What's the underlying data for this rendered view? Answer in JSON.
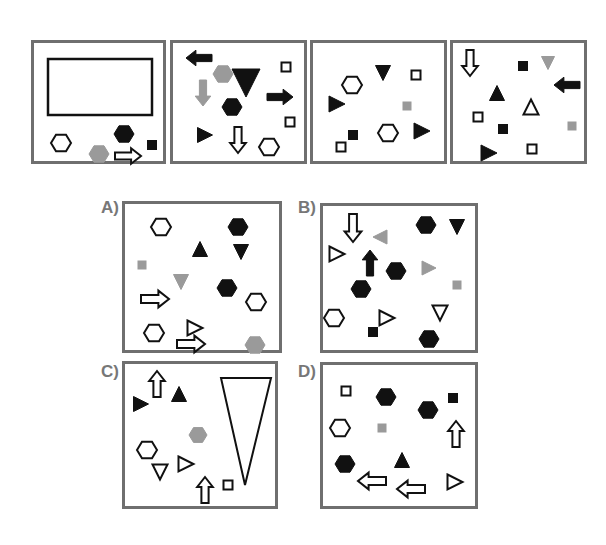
{
  "colors": {
    "black": "#111111",
    "gray": "#9a9a9a",
    "outline": "#111111",
    "panel_border": "#6f6f6f",
    "label": "#777777"
  },
  "sequence": [
    {
      "id": "seq-1",
      "x": 31,
      "y": 40,
      "w": 135,
      "h": 124,
      "shapes": [
        {
          "type": "rect",
          "x": 14,
          "y": 16,
          "w": 104,
          "h": 56,
          "fill": "none",
          "stroke": "#111",
          "sw": 2.5
        },
        {
          "type": "hexagon",
          "cx": 27,
          "cy": 100,
          "r": 10,
          "fill": "none"
        },
        {
          "type": "hexagon",
          "cx": 65,
          "cy": 111,
          "r": 10,
          "fill": "gray"
        },
        {
          "type": "hexagon",
          "cx": 90,
          "cy": 91,
          "r": 10,
          "fill": "black"
        },
        {
          "type": "arrow",
          "cx": 94,
          "cy": 113,
          "len": 26,
          "dir": "right",
          "fill": "none"
        },
        {
          "type": "square",
          "cx": 118,
          "cy": 102,
          "s": 9,
          "fill": "black"
        }
      ]
    },
    {
      "id": "seq-2",
      "x": 170,
      "y": 40,
      "w": 137,
      "h": 124,
      "shapes": [
        {
          "type": "arrow",
          "cx": 26,
          "cy": 15,
          "len": 26,
          "dir": "left",
          "fill": "black"
        },
        {
          "type": "hexagon",
          "cx": 50,
          "cy": 31,
          "r": 10,
          "fill": "gray"
        },
        {
          "type": "triangle",
          "cx": 73,
          "cy": 40,
          "size": 28,
          "dir": "down",
          "fill": "black"
        },
        {
          "type": "arrow",
          "cx": 30,
          "cy": 50,
          "len": 26,
          "dir": "down",
          "fill": "gray"
        },
        {
          "type": "arrow",
          "cx": 107,
          "cy": 54,
          "len": 26,
          "dir": "right",
          "fill": "black"
        },
        {
          "type": "hexagon",
          "cx": 59,
          "cy": 64,
          "r": 10,
          "fill": "black"
        },
        {
          "type": "square",
          "cx": 113,
          "cy": 24,
          "s": 9,
          "fill": "none"
        },
        {
          "type": "square",
          "cx": 117,
          "cy": 79,
          "s": 9,
          "fill": "none"
        },
        {
          "type": "triangle",
          "cx": 32,
          "cy": 92,
          "size": 15,
          "dir": "right",
          "fill": "black"
        },
        {
          "type": "arrow",
          "cx": 65,
          "cy": 97,
          "len": 26,
          "dir": "down",
          "fill": "none"
        },
        {
          "type": "hexagon",
          "cx": 96,
          "cy": 104,
          "r": 10,
          "fill": "none"
        }
      ]
    },
    {
      "id": "seq-3",
      "x": 310,
      "y": 40,
      "w": 137,
      "h": 124,
      "shapes": [
        {
          "type": "hexagon",
          "cx": 39,
          "cy": 42,
          "r": 10,
          "fill": "none"
        },
        {
          "type": "triangle",
          "cx": 70,
          "cy": 30,
          "size": 15,
          "dir": "down",
          "fill": "black"
        },
        {
          "type": "square",
          "cx": 103,
          "cy": 32,
          "s": 9,
          "fill": "none"
        },
        {
          "type": "triangle",
          "cx": 24,
          "cy": 61,
          "size": 16,
          "dir": "right",
          "fill": "black"
        },
        {
          "type": "square",
          "cx": 94,
          "cy": 63,
          "s": 8,
          "fill": "gray"
        },
        {
          "type": "square",
          "cx": 40,
          "cy": 92,
          "s": 9,
          "fill": "black"
        },
        {
          "type": "square",
          "cx": 28,
          "cy": 104,
          "s": 9,
          "fill": "none"
        },
        {
          "type": "hexagon",
          "cx": 75,
          "cy": 90,
          "r": 10,
          "fill": "none"
        },
        {
          "type": "triangle",
          "cx": 109,
          "cy": 88,
          "size": 16,
          "dir": "right",
          "fill": "black"
        }
      ]
    },
    {
      "id": "seq-4",
      "x": 450,
      "y": 40,
      "w": 137,
      "h": 124,
      "shapes": [
        {
          "type": "arrow",
          "cx": 17,
          "cy": 20,
          "len": 26,
          "dir": "down",
          "fill": "none"
        },
        {
          "type": "square",
          "cx": 70,
          "cy": 23,
          "s": 9,
          "fill": "black"
        },
        {
          "type": "triangle",
          "cx": 95,
          "cy": 20,
          "size": 13,
          "dir": "down",
          "fill": "gray"
        },
        {
          "type": "arrow",
          "cx": 114,
          "cy": 42,
          "len": 26,
          "dir": "left",
          "fill": "black"
        },
        {
          "type": "triangle",
          "cx": 44,
          "cy": 50,
          "size": 15,
          "dir": "up",
          "fill": "black"
        },
        {
          "type": "triangle",
          "cx": 78,
          "cy": 64,
          "size": 15,
          "dir": "up",
          "fill": "none"
        },
        {
          "type": "square",
          "cx": 25,
          "cy": 74,
          "s": 9,
          "fill": "none"
        },
        {
          "type": "square",
          "cx": 50,
          "cy": 86,
          "s": 9,
          "fill": "black"
        },
        {
          "type": "square",
          "cx": 119,
          "cy": 83,
          "s": 8,
          "fill": "gray"
        },
        {
          "type": "triangle",
          "cx": 36,
          "cy": 110,
          "size": 16,
          "dir": "right",
          "fill": "black"
        },
        {
          "type": "square",
          "cx": 79,
          "cy": 106,
          "s": 9,
          "fill": "none"
        }
      ]
    }
  ],
  "options": [
    {
      "id": "option-a",
      "label": "A)",
      "lx": 101,
      "ly": 198,
      "x": 122,
      "y": 201,
      "w": 160,
      "h": 152,
      "shapes": [
        {
          "type": "hexagon",
          "cx": 36,
          "cy": 23,
          "r": 10,
          "fill": "none"
        },
        {
          "type": "hexagon",
          "cx": 113,
          "cy": 23,
          "r": 10,
          "fill": "black"
        },
        {
          "type": "triangle",
          "cx": 75,
          "cy": 45,
          "size": 15,
          "dir": "up",
          "fill": "black"
        },
        {
          "type": "triangle",
          "cx": 116,
          "cy": 48,
          "size": 15,
          "dir": "down",
          "fill": "black"
        },
        {
          "type": "square",
          "cx": 17,
          "cy": 61,
          "s": 8,
          "fill": "gray"
        },
        {
          "type": "triangle",
          "cx": 56,
          "cy": 78,
          "size": 15,
          "dir": "down",
          "fill": "gray"
        },
        {
          "type": "hexagon",
          "cx": 102,
          "cy": 84,
          "r": 10,
          "fill": "black"
        },
        {
          "type": "arrow",
          "cx": 30,
          "cy": 95,
          "len": 28,
          "dir": "right",
          "fill": "none"
        },
        {
          "type": "hexagon",
          "cx": 131,
          "cy": 98,
          "r": 10,
          "fill": "none"
        },
        {
          "type": "hexagon",
          "cx": 29,
          "cy": 129,
          "r": 10,
          "fill": "none"
        },
        {
          "type": "triangle",
          "cx": 70,
          "cy": 124,
          "size": 15,
          "dir": "right",
          "fill": "none"
        },
        {
          "type": "arrow",
          "cx": 66,
          "cy": 140,
          "len": 28,
          "dir": "right",
          "fill": "none"
        },
        {
          "type": "hexagon",
          "cx": 130,
          "cy": 141,
          "r": 10,
          "fill": "gray"
        }
      ]
    },
    {
      "id": "option-b",
      "label": "B)",
      "lx": 298,
      "ly": 198,
      "x": 320,
      "y": 203,
      "w": 158,
      "h": 150,
      "shapes": [
        {
          "type": "arrow",
          "cx": 30,
          "cy": 22,
          "len": 28,
          "dir": "down",
          "fill": "none"
        },
        {
          "type": "hexagon",
          "cx": 103,
          "cy": 19,
          "r": 10,
          "fill": "black"
        },
        {
          "type": "triangle",
          "cx": 134,
          "cy": 21,
          "size": 15,
          "dir": "down",
          "fill": "black"
        },
        {
          "type": "triangle",
          "cx": 57,
          "cy": 31,
          "size": 14,
          "dir": "left",
          "fill": "gray"
        },
        {
          "type": "triangle",
          "cx": 14,
          "cy": 48,
          "size": 15,
          "dir": "right",
          "fill": "none"
        },
        {
          "type": "arrow",
          "cx": 47,
          "cy": 57,
          "len": 26,
          "dir": "up",
          "fill": "black"
        },
        {
          "type": "hexagon",
          "cx": 73,
          "cy": 65,
          "r": 10,
          "fill": "black"
        },
        {
          "type": "triangle",
          "cx": 106,
          "cy": 62,
          "size": 14,
          "dir": "right",
          "fill": "gray"
        },
        {
          "type": "hexagon",
          "cx": 38,
          "cy": 83,
          "r": 10,
          "fill": "black"
        },
        {
          "type": "square",
          "cx": 134,
          "cy": 79,
          "s": 8,
          "fill": "gray"
        },
        {
          "type": "hexagon",
          "cx": 11,
          "cy": 112,
          "r": 10,
          "fill": "none"
        },
        {
          "type": "triangle",
          "cx": 64,
          "cy": 112,
          "size": 15,
          "dir": "right",
          "fill": "none"
        },
        {
          "type": "triangle",
          "cx": 117,
          "cy": 107,
          "size": 15,
          "dir": "down",
          "fill": "none"
        },
        {
          "type": "square",
          "cx": 50,
          "cy": 126,
          "s": 9,
          "fill": "black"
        },
        {
          "type": "hexagon",
          "cx": 106,
          "cy": 133,
          "r": 10,
          "fill": "black"
        }
      ]
    },
    {
      "id": "option-c",
      "label": "C)",
      "lx": 101,
      "ly": 362,
      "x": 122,
      "y": 361,
      "w": 156,
      "h": 148,
      "shapes": [
        {
          "type": "arrow",
          "cx": 32,
          "cy": 20,
          "len": 26,
          "dir": "up",
          "fill": "none"
        },
        {
          "type": "triangle",
          "cx": 16,
          "cy": 40,
          "size": 15,
          "dir": "right",
          "fill": "black"
        },
        {
          "type": "triangle",
          "cx": 54,
          "cy": 30,
          "size": 15,
          "dir": "up",
          "fill": "black"
        },
        {
          "type": "polygon",
          "points": "96,14 146,14 120,121",
          "fill": "none"
        },
        {
          "type": "hexagon",
          "cx": 73,
          "cy": 71,
          "r": 9,
          "fill": "gray"
        },
        {
          "type": "hexagon",
          "cx": 22,
          "cy": 86,
          "r": 10,
          "fill": "none"
        },
        {
          "type": "triangle",
          "cx": 35,
          "cy": 108,
          "size": 15,
          "dir": "down",
          "fill": "none"
        },
        {
          "type": "triangle",
          "cx": 61,
          "cy": 100,
          "size": 15,
          "dir": "right",
          "fill": "none"
        },
        {
          "type": "arrow",
          "cx": 80,
          "cy": 126,
          "len": 26,
          "dir": "up",
          "fill": "none"
        },
        {
          "type": "square",
          "cx": 103,
          "cy": 121,
          "s": 9,
          "fill": "none"
        }
      ]
    },
    {
      "id": "option-d",
      "label": "D)",
      "lx": 298,
      "ly": 362,
      "x": 320,
      "y": 362,
      "w": 158,
      "h": 147,
      "shapes": [
        {
          "type": "square",
          "cx": 23,
          "cy": 26,
          "s": 9,
          "fill": "none"
        },
        {
          "type": "hexagon",
          "cx": 63,
          "cy": 32,
          "r": 10,
          "fill": "black"
        },
        {
          "type": "hexagon",
          "cx": 105,
          "cy": 45,
          "r": 10,
          "fill": "black"
        },
        {
          "type": "square",
          "cx": 130,
          "cy": 33,
          "s": 9,
          "fill": "black"
        },
        {
          "type": "hexagon",
          "cx": 17,
          "cy": 63,
          "r": 10,
          "fill": "none"
        },
        {
          "type": "square",
          "cx": 59,
          "cy": 63,
          "s": 8,
          "fill": "gray"
        },
        {
          "type": "arrow",
          "cx": 133,
          "cy": 69,
          "len": 26,
          "dir": "up",
          "fill": "none"
        },
        {
          "type": "hexagon",
          "cx": 22,
          "cy": 99,
          "r": 10,
          "fill": "black"
        },
        {
          "type": "triangle",
          "cx": 79,
          "cy": 95,
          "size": 15,
          "dir": "up",
          "fill": "black"
        },
        {
          "type": "arrow",
          "cx": 49,
          "cy": 116,
          "len": 28,
          "dir": "left",
          "fill": "none"
        },
        {
          "type": "arrow",
          "cx": 88,
          "cy": 124,
          "len": 28,
          "dir": "left",
          "fill": "none"
        },
        {
          "type": "triangle",
          "cx": 132,
          "cy": 117,
          "size": 15,
          "dir": "right",
          "fill": "none"
        }
      ]
    }
  ]
}
